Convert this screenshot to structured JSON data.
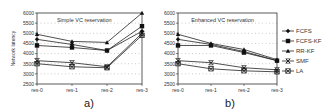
{
  "figure": {
    "panel_a_caption": "a)",
    "panel_b_caption": "b)"
  },
  "chart_data": [
    {
      "type": "line",
      "title": "Simple VC reservation",
      "xlabel": "",
      "ylabel": "Network latency",
      "categories": [
        "res-0",
        "res-1",
        "res-2",
        "res-3"
      ],
      "yticks": [
        2500,
        3000,
        3500,
        4000,
        4500,
        5000,
        5500,
        6000
      ],
      "ylim": [
        2500,
        6000
      ],
      "grid": "horizontal dotted",
      "series": [
        {
          "name": "FCFS",
          "marker": "diamond",
          "values": [
            4700,
            4450,
            4150,
            5100
          ]
        },
        {
          "name": "FCFS-KF",
          "marker": "square",
          "values": [
            4400,
            4300,
            4150,
            5350
          ]
        },
        {
          "name": "RR-KF",
          "marker": "triangle",
          "values": [
            4950,
            4600,
            4550,
            6000
          ]
        },
        {
          "name": "SMF",
          "marker": "x-bar",
          "values": [
            3650,
            3550,
            3350,
            5000
          ]
        },
        {
          "name": "LA",
          "marker": "x-square",
          "values": [
            3500,
            3350,
            3300,
            4900
          ]
        }
      ]
    },
    {
      "type": "line",
      "title": "Enhanced VC reservation",
      "xlabel": "",
      "ylabel": "Network latency",
      "categories": [
        "res-0",
        "res-1",
        "res-2",
        "res-3"
      ],
      "yticks": [
        2500,
        3000,
        3500,
        4000,
        4500,
        5000,
        5500,
        6000
      ],
      "ylim": [
        2500,
        6000
      ],
      "grid": "horizontal dotted",
      "legend_position": "right",
      "series": [
        {
          "name": "FCFS",
          "marker": "diamond",
          "values": [
            4700,
            4450,
            4100,
            3650
          ]
        },
        {
          "name": "FCFS-KF",
          "marker": "square",
          "values": [
            4400,
            4400,
            4050,
            3650
          ]
        },
        {
          "name": "RR-KF",
          "marker": "triangle",
          "values": [
            4950,
            4500,
            4200,
            3700
          ]
        },
        {
          "name": "SMF",
          "marker": "x-bar",
          "values": [
            3650,
            3550,
            3300,
            3200
          ]
        },
        {
          "name": "LA",
          "marker": "x-square",
          "values": [
            3500,
            3250,
            3150,
            3100
          ]
        }
      ]
    }
  ]
}
